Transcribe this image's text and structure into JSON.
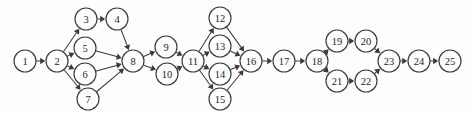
{
  "figure": {
    "width": 471,
    "height": 115,
    "background_color": "#fefefe",
    "stroke_color": "#3a3a3a",
    "node_fill_color": "#ffffff",
    "label_color": "#1c1c1c",
    "node_radius": 11
  },
  "chart_data": {
    "type": "diagram",
    "subtype": "directed-graph",
    "directed": true,
    "node_count": 25,
    "edge_count": 30,
    "nodes": [
      {
        "id": 1,
        "label": "1",
        "x": 25,
        "y": 61
      },
      {
        "id": 2,
        "label": "2",
        "x": 57,
        "y": 61
      },
      {
        "id": 3,
        "label": "3",
        "x": 86,
        "y": 19
      },
      {
        "id": 4,
        "label": "4",
        "x": 117,
        "y": 19
      },
      {
        "id": 5,
        "label": "5",
        "x": 85,
        "y": 48
      },
      {
        "id": 6,
        "label": "6",
        "x": 85,
        "y": 74
      },
      {
        "id": 7,
        "label": "7",
        "x": 88,
        "y": 99
      },
      {
        "id": 8,
        "label": "8",
        "x": 133,
        "y": 61
      },
      {
        "id": 9,
        "label": "9",
        "x": 166,
        "y": 47
      },
      {
        "id": 10,
        "label": "10",
        "x": 167,
        "y": 74
      },
      {
        "id": 11,
        "label": "11",
        "x": 193,
        "y": 61
      },
      {
        "id": 12,
        "label": "12",
        "x": 220,
        "y": 18
      },
      {
        "id": 13,
        "label": "13",
        "x": 220,
        "y": 46
      },
      {
        "id": 14,
        "label": "14",
        "x": 220,
        "y": 74
      },
      {
        "id": 15,
        "label": "15",
        "x": 220,
        "y": 99
      },
      {
        "id": 16,
        "label": "16",
        "x": 251,
        "y": 61
      },
      {
        "id": 17,
        "label": "17",
        "x": 284,
        "y": 61
      },
      {
        "id": 18,
        "label": "18",
        "x": 317,
        "y": 61
      },
      {
        "id": 19,
        "label": "19",
        "x": 337,
        "y": 41
      },
      {
        "id": 20,
        "label": "20",
        "x": 366,
        "y": 41
      },
      {
        "id": 21,
        "label": "21",
        "x": 337,
        "y": 81
      },
      {
        "id": 22,
        "label": "22",
        "x": 366,
        "y": 81
      },
      {
        "id": 23,
        "label": "23",
        "x": 389,
        "y": 61
      },
      {
        "id": 24,
        "label": "24",
        "x": 419,
        "y": 61
      },
      {
        "id": 25,
        "label": "25",
        "x": 450,
        "y": 61
      }
    ],
    "edges": [
      {
        "from": 1,
        "to": 2
      },
      {
        "from": 2,
        "to": 3
      },
      {
        "from": 2,
        "to": 5
      },
      {
        "from": 2,
        "to": 6
      },
      {
        "from": 2,
        "to": 7
      },
      {
        "from": 3,
        "to": 4
      },
      {
        "from": 4,
        "to": 8
      },
      {
        "from": 5,
        "to": 8
      },
      {
        "from": 6,
        "to": 8
      },
      {
        "from": 7,
        "to": 8
      },
      {
        "from": 8,
        "to": 9
      },
      {
        "from": 8,
        "to": 10
      },
      {
        "from": 9,
        "to": 11
      },
      {
        "from": 10,
        "to": 11
      },
      {
        "from": 11,
        "to": 12
      },
      {
        "from": 11,
        "to": 13
      },
      {
        "from": 11,
        "to": 14
      },
      {
        "from": 11,
        "to": 15
      },
      {
        "from": 12,
        "to": 16
      },
      {
        "from": 13,
        "to": 16
      },
      {
        "from": 14,
        "to": 16
      },
      {
        "from": 15,
        "to": 16
      },
      {
        "from": 16,
        "to": 17
      },
      {
        "from": 17,
        "to": 18
      },
      {
        "from": 18,
        "to": 19
      },
      {
        "from": 18,
        "to": 21
      },
      {
        "from": 19,
        "to": 20
      },
      {
        "from": 21,
        "to": 22
      },
      {
        "from": 20,
        "to": 23
      },
      {
        "from": 22,
        "to": 23
      },
      {
        "from": 23,
        "to": 24
      },
      {
        "from": 24,
        "to": 25
      }
    ]
  }
}
